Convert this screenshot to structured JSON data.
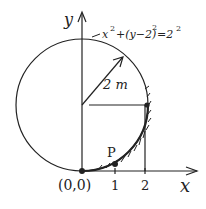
{
  "diagram": {
    "axes": {
      "x_label": "x",
      "y_label": "y",
      "origin_label": "(0,0)",
      "x_ticks": [
        "1",
        "2"
      ]
    },
    "circle": {
      "equation_prefix": "x",
      "equation": "x² + (y − 2)² = 2²",
      "eq_parts": {
        "a": "x",
        "b": "+(y−2)",
        "c": "=2",
        "sup": "2"
      },
      "radius_label": "2 m",
      "center": [
        0,
        2
      ],
      "radius": 2
    },
    "point_label": "P",
    "colors": {
      "ink": "#222222",
      "background": "#ffffff"
    }
  }
}
